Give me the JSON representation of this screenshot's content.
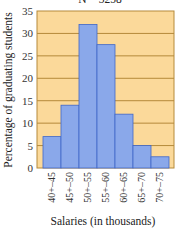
{
  "chart_data": {
    "type": "bar",
    "title": "N = 3258",
    "xlabel": "Salaries (in thousands)",
    "ylabel": "Percentage of graduating students",
    "categories": [
      "40+–45",
      "45+–50",
      "50+–55",
      "55+–60",
      "60+–65",
      "65+–70",
      "70+–75"
    ],
    "values": [
      7,
      14,
      32,
      27.5,
      12,
      5,
      2.5
    ],
    "ylim": [
      0,
      35
    ],
    "yticks": [
      0,
      5,
      10,
      15,
      20,
      25,
      30,
      35
    ],
    "grid": true,
    "colors": {
      "bar": "#8aa8ea",
      "bar_edge": "#3f66c8",
      "background": "#fbd99a",
      "grid": "#b58a3a"
    }
  }
}
